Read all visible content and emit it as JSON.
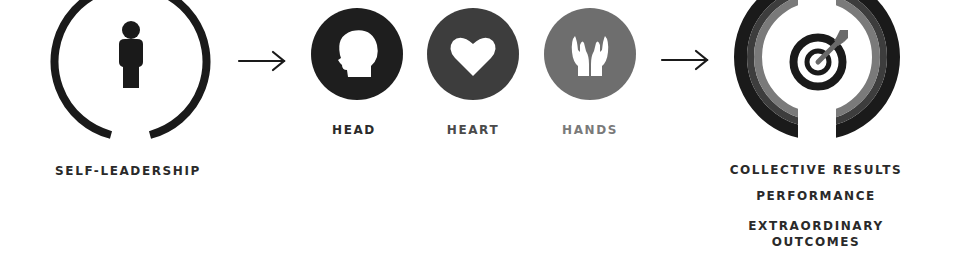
{
  "diagram": {
    "stages": [
      {
        "id": "self-leadership",
        "label": "SELF-LEADERSHIP",
        "icon": "person-icon"
      },
      {
        "id": "head",
        "label": "HEAD",
        "icon": "head-profile-icon",
        "color": "#1e1e1e"
      },
      {
        "id": "heart",
        "label": "HEART",
        "icon": "heart-icon",
        "color": "#3d3d3d"
      },
      {
        "id": "hands",
        "label": "HANDS",
        "icon": "open-hands-icon",
        "color": "#6e6e6e"
      },
      {
        "id": "results",
        "icon": "target-icon",
        "labels": [
          "COLLECTIVE RESULTS",
          "PERFORMANCE",
          "EXTRAORDINARY",
          "OUTCOMES"
        ]
      }
    ],
    "connectors": [
      {
        "from": "self-leadership",
        "to": "head-heart-hands",
        "type": "arrow"
      },
      {
        "from": "head-heart-hands",
        "to": "results",
        "type": "arrow"
      }
    ],
    "colors": {
      "black": "#1a1a1a",
      "dark_gray": "#3d3d3d",
      "mid_gray": "#6e6e6e",
      "background": "#ffffff"
    }
  }
}
